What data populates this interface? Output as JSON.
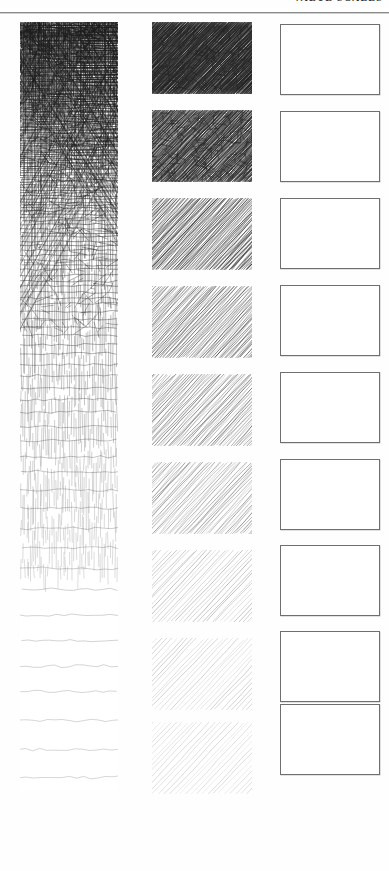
{
  "page": {
    "background_color": "#fefefe",
    "width": 389,
    "height": 871
  },
  "header": {
    "running_head": "VALUE SCALES",
    "running_head_clipped": true,
    "rule_color": "#8b8b8b"
  },
  "columns": [
    {
      "name": "continuous-gradient-strip",
      "kind": "single-continuous-strip",
      "technique": "crosshatch",
      "description": "One tall unbroken strip graded from dense crosshatch at top to sparse wavy horizontal lines at bottom",
      "x": 20,
      "y": 22,
      "width": 98,
      "height": 768,
      "stroke_color": "#1c1c1c"
    },
    {
      "name": "hatched-swatch-scale",
      "kind": "nine-discrete-swatches",
      "technique": "diagonal-hatching",
      "description": "Nine separate diagonal pencil-hatched squares stepping from darkest to lightest",
      "x": 152,
      "y": 22,
      "width": 100,
      "stroke_color": "#242424"
    },
    {
      "name": "blank-practice-boxes",
      "kind": "nine-empty-rectangles",
      "technique": "none",
      "description": "Nine empty bordered rectangles for the reader to fill in",
      "x": 280,
      "y": 24,
      "width": 100,
      "border_color": "#6f6f72"
    }
  ],
  "chart_data": {
    "type": "table",
    "xlabel": "",
    "ylabel": "Value step (1 = darkest, 9 = lightest)",
    "categories": [
      "1",
      "2",
      "3",
      "4",
      "5",
      "6",
      "7",
      "8",
      "9"
    ],
    "series": [
      {
        "name": "Diagonal hatched swatch darkness (%)",
        "values": [
          94,
          86,
          76,
          64,
          52,
          41,
          28,
          16,
          7
        ]
      },
      {
        "name": "Blank practice box fill (%)",
        "values": [
          0,
          0,
          0,
          0,
          0,
          0,
          0,
          0,
          0
        ]
      }
    ],
    "gradient_strip": {
      "name": "Continuous crosshatch gradient darkness (%) top to bottom",
      "samples": [
        97,
        95,
        92,
        88,
        83,
        77,
        70,
        62,
        53,
        44,
        35,
        27,
        20,
        14,
        9,
        5
      ]
    },
    "grid": false,
    "legend_position": "none"
  },
  "swatch_rows": [
    {
      "index": 1,
      "top": 0,
      "darkness": 94,
      "ink": "#171717",
      "density": 1.0
    },
    {
      "index": 2,
      "top": 88,
      "darkness": 86,
      "ink": "#232323",
      "density": 0.9
    },
    {
      "index": 3,
      "top": 176,
      "darkness": 76,
      "ink": "#2f2f2f",
      "density": 0.78
    },
    {
      "index": 4,
      "top": 264,
      "darkness": 64,
      "ink": "#3d3d3d",
      "density": 0.65
    },
    {
      "index": 5,
      "top": 352,
      "darkness": 52,
      "ink": "#4d4d4d",
      "density": 0.53
    },
    {
      "index": 6,
      "top": 440,
      "darkness": 41,
      "ink": "#5c5c5c",
      "density": 0.42
    },
    {
      "index": 7,
      "top": 528,
      "darkness": 28,
      "ink": "#737373",
      "density": 0.3
    },
    {
      "index": 8,
      "top": 616,
      "darkness": 16,
      "ink": "#8f8f8f",
      "density": 0.19
    },
    {
      "index": 9,
      "top": 700,
      "darkness": 7,
      "ink": "#a8a8a8",
      "density": 0.1
    }
  ],
  "empty_box_rows": [
    {
      "index": 1,
      "top": 0
    },
    {
      "index": 2,
      "top": 87
    },
    {
      "index": 3,
      "top": 174
    },
    {
      "index": 4,
      "top": 261
    },
    {
      "index": 5,
      "top": 348
    },
    {
      "index": 6,
      "top": 435
    },
    {
      "index": 7,
      "top": 521
    },
    {
      "index": 8,
      "top": 607
    },
    {
      "index": 9,
      "top": 680
    }
  ]
}
